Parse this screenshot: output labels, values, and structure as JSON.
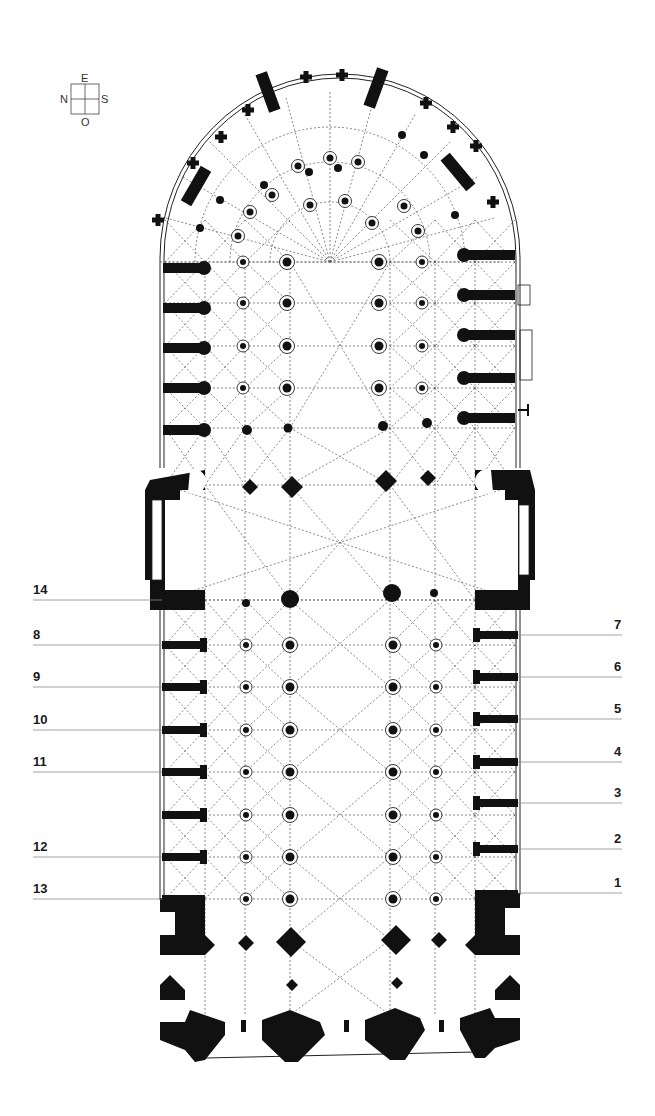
{
  "compass": {
    "north": "N",
    "east": "E",
    "south": "S",
    "west": "O"
  },
  "colors": {
    "ink": "#111111",
    "leader_line": "#8a8a8a",
    "background": "#ffffff"
  },
  "left_labels": [
    {
      "text": "14",
      "y": 600
    },
    {
      "text": "8",
      "y": 645
    },
    {
      "text": "9",
      "y": 687
    },
    {
      "text": "10",
      "y": 730
    },
    {
      "text": "11",
      "y": 772
    },
    {
      "text": "12",
      "y": 857
    },
    {
      "text": "13",
      "y": 899
    }
  ],
  "right_labels": [
    {
      "text": "7",
      "y": 635
    },
    {
      "text": "6",
      "y": 677
    },
    {
      "text": "5",
      "y": 719
    },
    {
      "text": "4",
      "y": 762
    },
    {
      "text": "3",
      "y": 803
    },
    {
      "text": "2",
      "y": 849
    },
    {
      "text": "1",
      "y": 893
    }
  ],
  "plan": {
    "nave_piers_y": [
      645,
      687,
      730,
      772,
      815,
      857,
      899
    ],
    "choir_piers_y": [
      262,
      303,
      346,
      388,
      428
    ],
    "left_buttress_y": [
      645,
      687,
      730,
      772,
      815,
      857
    ],
    "right_buttress_y": [
      635,
      677,
      719,
      762,
      803,
      849
    ],
    "choir_left_buttress_y": [
      268,
      308,
      348,
      388,
      430
    ],
    "choir_right_buttress_y": [
      255,
      295,
      335,
      378,
      418
    ]
  }
}
